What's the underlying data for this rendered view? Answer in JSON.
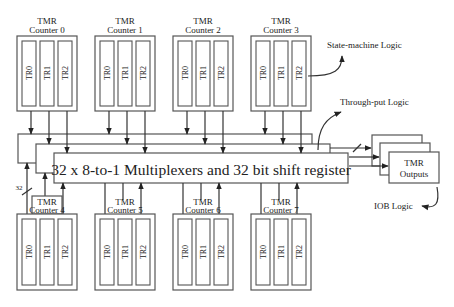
{
  "diagram": {
    "mux_label": "32 x 8-to-1 Multiplexers and 32 bit shift register",
    "bus_width_label": "32",
    "tmr_outputs": {
      "line1": "TMR",
      "line2": "Outputs"
    },
    "annotations": {
      "state_machine": "State-machine Logic",
      "throughput": "Through-put Logic",
      "iob": "IOB Logic"
    },
    "counters_top": [
      {
        "title": "TMR",
        "name": "Counter 0",
        "regs": [
          "TR0",
          "TR1",
          "TR2"
        ]
      },
      {
        "title": "TMR",
        "name": "Counter 1",
        "regs": [
          "TR0",
          "TR1",
          "TR2"
        ]
      },
      {
        "title": "TMR",
        "name": "Counter 2",
        "regs": [
          "TR0",
          "TR1",
          "TR2"
        ]
      },
      {
        "title": "TMR",
        "name": "Counter 3",
        "regs": [
          "TR0",
          "TR1",
          "TR2"
        ]
      }
    ],
    "counters_bottom": [
      {
        "title": "TMR",
        "name": "Counter 4",
        "regs": [
          "TR0",
          "TR1",
          "TR2"
        ]
      },
      {
        "title": "TMR",
        "name": "Counter 5",
        "regs": [
          "TR0",
          "TR1",
          "TR2"
        ]
      },
      {
        "title": "TMR",
        "name": "Counter 6",
        "regs": [
          "TR0",
          "TR1",
          "TR2"
        ]
      },
      {
        "title": "TMR",
        "name": "Counter 7",
        "regs": [
          "TR0",
          "TR1",
          "TR2"
        ]
      }
    ]
  }
}
